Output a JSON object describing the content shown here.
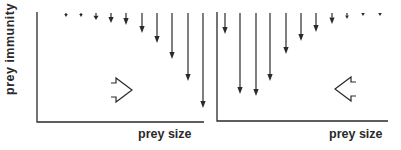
{
  "labels": {
    "y_axis": "prey  immunity",
    "x_axis_left": "prey size",
    "x_axis_right": "prey size"
  },
  "colors": {
    "ink": "#2a2a2a",
    "background": "#ffffff"
  },
  "panels": [
    {
      "name": "left",
      "axis": {
        "x": 37,
        "top": 12,
        "baseline": 122,
        "right": 204
      },
      "arrow_top": 13,
      "arrows": [
        {
          "x": 66,
          "tip": 17
        },
        {
          "x": 81,
          "tip": 17
        },
        {
          "x": 96,
          "tip": 20
        },
        {
          "x": 111,
          "tip": 23
        },
        {
          "x": 126,
          "tip": 25
        },
        {
          "x": 142,
          "tip": 33
        },
        {
          "x": 157,
          "tip": 43
        },
        {
          "x": 172,
          "tip": 59
        },
        {
          "x": 188,
          "tip": 81
        },
        {
          "x": 203,
          "tip": 108
        }
      ],
      "shift_arrow": {
        "direction": "left",
        "cx": 123,
        "cy": 90
      }
    },
    {
      "name": "right",
      "axis": {
        "x": 217,
        "top": 12,
        "baseline": 121,
        "right": 388
      },
      "arrow_top": 13,
      "arrows": [
        {
          "x": 225,
          "tip": 34
        },
        {
          "x": 240,
          "tip": 94
        },
        {
          "x": 256,
          "tip": 96
        },
        {
          "x": 270,
          "tip": 81
        },
        {
          "x": 286,
          "tip": 54
        },
        {
          "x": 301,
          "tip": 41
        },
        {
          "x": 316,
          "tip": 32
        },
        {
          "x": 332,
          "tip": 24
        },
        {
          "x": 347,
          "tip": 19
        },
        {
          "x": 363,
          "tip": 16
        },
        {
          "x": 380,
          "tip": 16
        }
      ],
      "shift_arrow": {
        "direction": "right",
        "cx": 344,
        "cy": 89
      }
    }
  ]
}
